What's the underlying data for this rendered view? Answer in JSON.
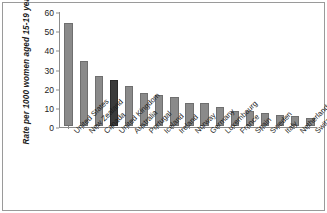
{
  "chart_data": {
    "type": "bar",
    "title": "",
    "xlabel": "",
    "ylabel": "Rate per 1000 women aged 15-19 years",
    "ylim": [
      0,
      60
    ],
    "yticks": [
      0,
      10,
      20,
      30,
      40,
      50,
      60
    ],
    "grid": false,
    "legend": "none",
    "highlight_category": "United Kingdom",
    "colors": {
      "bar": "#8a8a8a",
      "bar_border": "#6f6f6f",
      "highlight_bar": "#3b3b3b",
      "highlight_bar_border": "#2a2a2a",
      "axis": "#8c8c8c",
      "frame": "#9a9a9a",
      "text": "#1b1b1b",
      "background": "#ffffff"
    },
    "categories": [
      "United States",
      "New Zealand",
      "Canada",
      "United Kingdom",
      "Australia",
      "Portugal",
      "Iceland",
      "Ireland",
      "Norway",
      "Germany",
      "Luxembourg",
      "France",
      "Spain",
      "Sweden",
      "Italy",
      "Netherlands",
      "Switzerland"
    ],
    "values": [
      54,
      34,
      26,
      24,
      21,
      17,
      16,
      15,
      12,
      12,
      10,
      8,
      8,
      7,
      6,
      5,
      4
    ]
  }
}
